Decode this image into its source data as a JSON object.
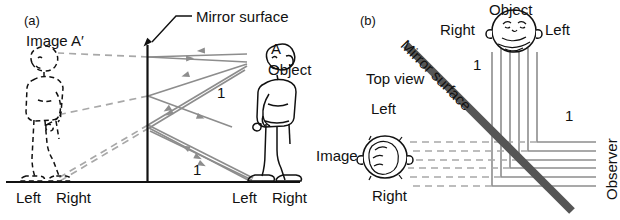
{
  "figure": {
    "panel_a": {
      "id": "(a)",
      "image_label": "Image A′",
      "mirror_label": "Mirror surface",
      "point_a": "A",
      "object_label": "Object",
      "ray_label_upper": "1",
      "ray_label_lower": "1",
      "ground_left_image": "Left",
      "ground_right_image": "Right",
      "ground_left_object": "Left",
      "ground_right_object": "Right"
    },
    "panel_b": {
      "id": "(b)",
      "object_label": "Object",
      "object_right": "Right",
      "object_left": "Left",
      "mirror_label": "Mirror surface",
      "top_view_label": "Top view",
      "image_left": "Left",
      "image_label": "Image",
      "image_right": "Right",
      "observer_label": "Observer",
      "ray_label_object": "1",
      "ray_label_observer": "1"
    }
  },
  "colors": {
    "ink": "#111111",
    "ray": "#8d8d8d",
    "virtual_ray": "#a8a8a8",
    "mirror_band": "#555555",
    "background": "#ffffff"
  }
}
